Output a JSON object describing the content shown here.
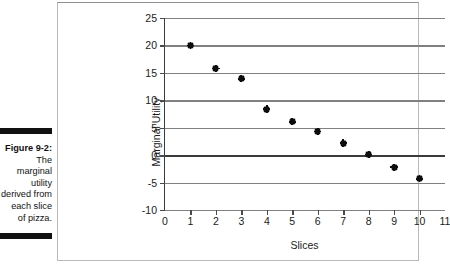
{
  "caption": {
    "figure_number": "Figure 9-2:",
    "lines": [
      "The",
      "marginal",
      "utility",
      "derived from",
      "each slice",
      "of pizza."
    ]
  },
  "chart_data": {
    "type": "scatter",
    "title": "",
    "xlabel": "Slices",
    "ylabel": "Marginal Utility",
    "xlim": [
      0,
      11
    ],
    "ylim": [
      -10,
      25
    ],
    "grid": true,
    "legend": false,
    "xticks": [
      "0",
      "1",
      "2",
      "3",
      "4",
      "5",
      "6",
      "7",
      "8",
      "9",
      "10",
      "11"
    ],
    "yticks": [
      "25",
      "20",
      "15",
      "10",
      "5",
      "0",
      "-5",
      "-10"
    ],
    "marker_color": "#0d0d0d",
    "gridline_color": "#808080",
    "axis_color": "#3a3a3a",
    "x": [
      1,
      2,
      3,
      4,
      5,
      6,
      7,
      8,
      9,
      10
    ],
    "y": [
      20,
      15.8,
      13.9,
      8.4,
      6.1,
      4.3,
      2.2,
      0.1,
      -2.2,
      -4.3
    ],
    "points": [
      {
        "x": 1,
        "y": 20
      },
      {
        "x": 2,
        "y": 15.8
      },
      {
        "x": 3,
        "y": 13.9
      },
      {
        "x": 4,
        "y": 8.4
      },
      {
        "x": 5,
        "y": 6.1
      },
      {
        "x": 6,
        "y": 4.3
      },
      {
        "x": 7,
        "y": 2.2
      },
      {
        "x": 8,
        "y": 0.1
      },
      {
        "x": 9,
        "y": -2.2
      },
      {
        "x": 10,
        "y": -4.3
      }
    ]
  }
}
